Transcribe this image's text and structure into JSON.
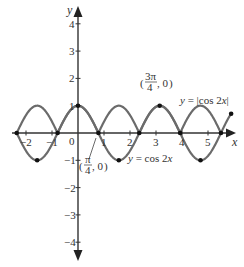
{
  "chart_data": {
    "type": "line",
    "title": "",
    "xlabel": "x",
    "ylabel": "y",
    "xlim": [
      -2.3,
      6.1
    ],
    "ylim": [
      -4.8,
      4.6
    ],
    "grid": false,
    "x_ticks": [
      -2,
      -1,
      1,
      2,
      3,
      4,
      5
    ],
    "x_tick_labels": [
      "−2",
      "−1",
      "1",
      "2",
      "3",
      "4",
      "5"
    ],
    "y_ticks": [
      4,
      3,
      2,
      1,
      -1,
      -2,
      -3,
      -4
    ],
    "y_tick_labels": [
      "4",
      "3",
      "2",
      "1",
      "−1",
      "−2",
      "−3",
      "−4"
    ],
    "origin_label": "0",
    "series": [
      {
        "name": "y = cos 2x",
        "function": "cos(2x)",
        "x_range": [
          -2.356,
          5.498
        ],
        "color": "#6b6b6b",
        "marked_points": [
          [
            -1.571,
            -1
          ],
          [
            0,
            1
          ],
          [
            1.571,
            -1
          ],
          [
            3.142,
            1
          ],
          [
            4.712,
            -1
          ]
        ]
      },
      {
        "name": "y = |cos 2x|",
        "function": "abs(cos(2x))",
        "x_range": [
          -2.356,
          5.89
        ],
        "color": "#6b6b6b",
        "marked_points": [
          [
            -2.356,
            0
          ],
          [
            -0.785,
            0
          ],
          [
            0.785,
            0
          ],
          [
            2.356,
            0
          ],
          [
            3.927,
            0
          ],
          [
            5.498,
            0
          ],
          [
            5.89,
            0.707
          ]
        ]
      }
    ],
    "annotations": [
      {
        "text": "y = |cos 2x|",
        "near": [
          4.5,
          1.0
        ]
      },
      {
        "text": "y = cos 2x",
        "near": [
          2.5,
          -1.2
        ]
      },
      {
        "text": "(π/4, 0)",
        "point": [
          0.785,
          0
        ]
      },
      {
        "text": "(3π/4, 0)",
        "point": [
          2.356,
          0
        ]
      }
    ]
  },
  "labels": {
    "x_axis": "x",
    "y_axis": "y",
    "origin": "0",
    "abs_curve": "y = |cos 2x|",
    "cos_curve": "y = cos 2x",
    "pi4_num": "π",
    "pi4_den": "4",
    "pi4_rest": ", 0",
    "pi34_num": "3π",
    "pi34_den": "4",
    "pi34_rest": ", 0"
  }
}
